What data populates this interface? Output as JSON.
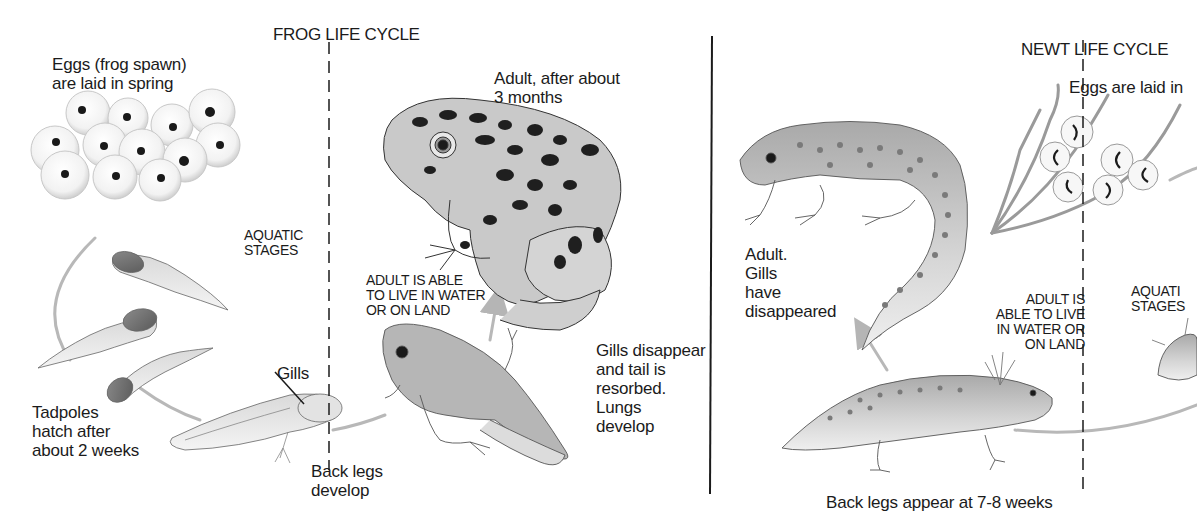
{
  "frog": {
    "title": "FROG LIFE CYCLE",
    "eggs_label": "Eggs (frog spawn)\nare laid in spring",
    "adult_label": "Adult, after about\n3 months",
    "aquatic_label": "AQUATIC\nSTAGES",
    "amphibious_label": "ADULT IS ABLE\nTO LIVE IN WATER\nOR ON LAND",
    "metamorph_label": "Gills disappear\nand tail is\nresorbed.\nLungs\ndevelop",
    "gills_label": "Gills",
    "tadpoles_label": "Tadpoles\nhatch after\nabout 2 weeks",
    "backlegs_label": "Back legs\ndevelop"
  },
  "newt": {
    "title": "NEWT LIFE CYCLE",
    "eggs_label": "Eggs are laid in",
    "adult_label": "Adult.\nGills\nhave\ndisappeared",
    "amphibious_label": "ADULT IS\nABLE TO LIVE\nIN WATER OR\nON LAND",
    "aquatic_label": "AQUATI\nSTAGES",
    "backlegs_label": "Back legs appear at 7-8 weeks"
  },
  "colors": {
    "ink": "#1b1b1b",
    "cycle_arrow": "#b5b5b5",
    "body_gray": "#a8a8a8",
    "spot": "#2a2a2a"
  }
}
